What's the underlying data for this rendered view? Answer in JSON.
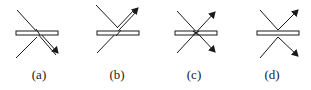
{
  "figure": {
    "type": "ray-diagram",
    "colors": {
      "line": "#1a1a1a",
      "plate_fill": "#ffffff",
      "background": "#ffffff"
    },
    "panels": [
      {
        "id": "a",
        "caption": "(a)",
        "offset_x": 0,
        "plate": {
          "x": 16,
          "y": 31,
          "w": 42,
          "h": 4
        },
        "description": "Incident ray from upper-left transmits through plate as a double-line arrow to lower-right; second ray from lower-left meets the plate underside."
      },
      {
        "id": "b",
        "caption": "(b)",
        "offset_x": 78,
        "plate": {
          "x": 19,
          "y": 31,
          "w": 42,
          "h": 4
        },
        "description": "Ray from lower-left transmits through plate as a double-line arrow to upper-right; ray from upper-left meets plate top surface."
      },
      {
        "id": "c",
        "caption": "(c)",
        "offset_x": 155,
        "plate": {
          "x": 20,
          "y": 31,
          "w": 42,
          "h": 4
        },
        "description": "Two rays cross at the plate center, both exiting with single arrows to upper-right and lower-right."
      },
      {
        "id": "d",
        "caption": "(d)",
        "offset_x": 233,
        "plate": {
          "x": 24,
          "y": 31,
          "w": 42,
          "h": 4
        },
        "description": "Reflection on each side: a V above the plate with an arrow to upper-right and a V below with an arrow to lower-right."
      }
    ]
  }
}
